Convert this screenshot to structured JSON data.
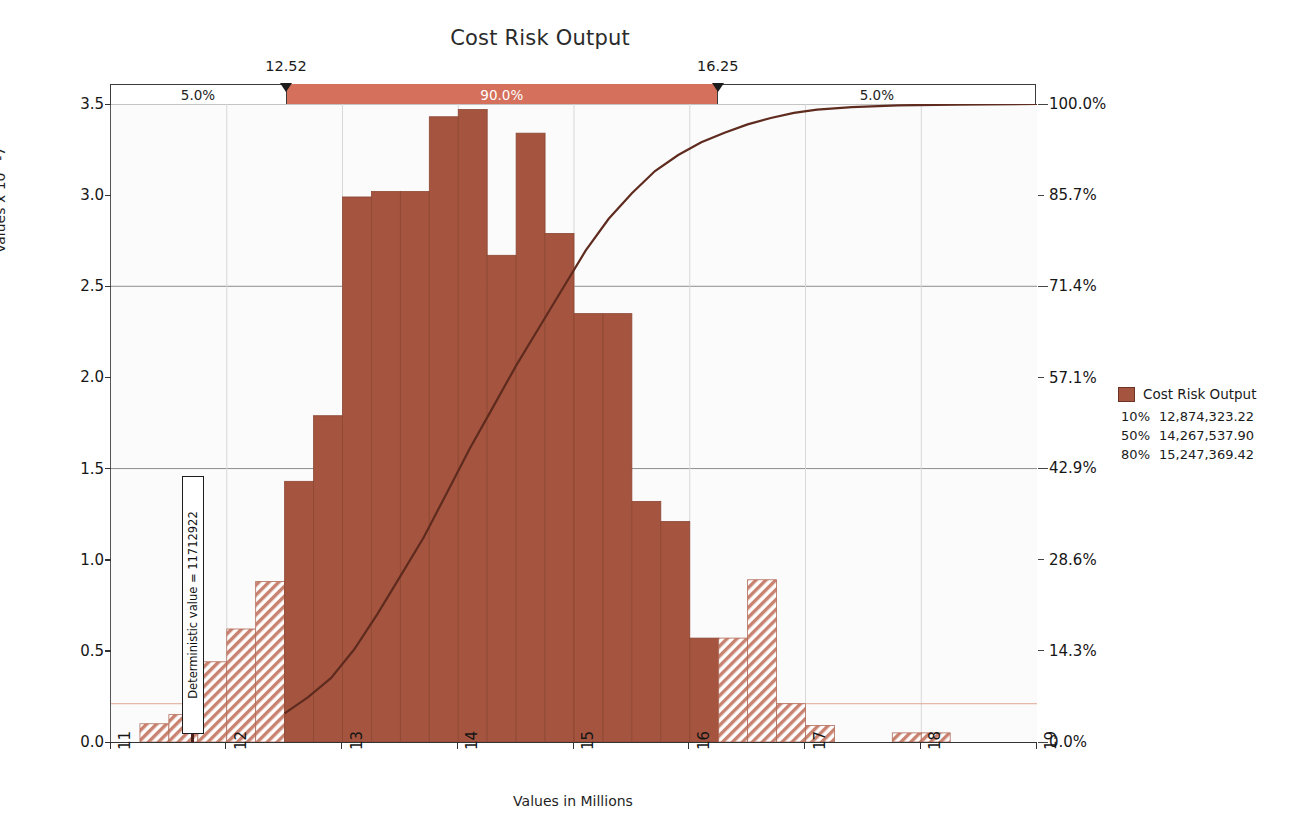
{
  "title": "Cost Risk Output",
  "axes": {
    "ylabel_left": "Values x 10^-7",
    "xlabel": "Values in Millions",
    "yticks_left": [
      "0.0",
      "0.5",
      "1.0",
      "1.5",
      "2.0",
      "2.5",
      "3.0",
      "3.5"
    ],
    "yticks_right": [
      "0.0%",
      "14.3%",
      "28.6%",
      "42.9%",
      "57.1%",
      "71.4%",
      "85.7%",
      "100.0%"
    ],
    "xticks": [
      "11",
      "12",
      "13",
      "14",
      "15",
      "16",
      "17",
      "18",
      "19"
    ],
    "xlim": [
      11,
      19
    ],
    "ylim_left": [
      0.0,
      3.5
    ],
    "ylim_right": [
      0.0,
      100.0
    ]
  },
  "slider": {
    "left_pct": "5.0%",
    "mid_pct": "90.0%",
    "right_pct": "5.0%",
    "left_marker": "12.52",
    "right_marker": "16.25",
    "band_color": "#D4705C"
  },
  "annotation": {
    "deterministic_label": "Deterministic value = 11712922",
    "deterministic_x": 11.712922
  },
  "legend": {
    "series_name": "Cost Risk Output",
    "swatch_color": "#A4543F",
    "stats": [
      {
        "percentile": "10%",
        "value": "12,874,323.22"
      },
      {
        "percentile": "50%",
        "value": "14,267,537.90"
      },
      {
        "percentile": "80%",
        "value": "15,247,369.42"
      }
    ]
  },
  "colors": {
    "bar_fill": "#A4543F",
    "bar_hatch": "#C98270",
    "curve": "#5E2B1E",
    "grid": "#9a9a9a",
    "plot_bg": "#fbfbfc"
  },
  "chart_data": {
    "type": "bar",
    "title": "Cost Risk Output",
    "xlabel": "Values in Millions",
    "ylabel": "Values x 10^-7",
    "xlim": [
      11,
      19
    ],
    "ylim": [
      0,
      3.5
    ],
    "grid": true,
    "legend_position": "right",
    "bin_width": 0.25,
    "in_range_min": 12.52,
    "in_range_max": 16.25,
    "bins": [
      {
        "x0": 11.0,
        "x1": 11.25,
        "value": 0.0,
        "in_range": false
      },
      {
        "x0": 11.25,
        "x1": 11.5,
        "value": 0.1,
        "in_range": false
      },
      {
        "x0": 11.5,
        "x1": 11.75,
        "value": 0.15,
        "in_range": false
      },
      {
        "x0": 11.75,
        "x1": 12.0,
        "value": 0.44,
        "in_range": false
      },
      {
        "x0": 12.0,
        "x1": 12.25,
        "value": 0.62,
        "in_range": false
      },
      {
        "x0": 12.25,
        "x1": 12.5,
        "value": 0.88,
        "in_range": false
      },
      {
        "x0": 12.5,
        "x1": 12.75,
        "value": 1.43,
        "in_range": true
      },
      {
        "x0": 12.75,
        "x1": 13.0,
        "value": 1.79,
        "in_range": true
      },
      {
        "x0": 13.0,
        "x1": 13.25,
        "value": 2.99,
        "in_range": true
      },
      {
        "x0": 13.25,
        "x1": 13.5,
        "value": 3.02,
        "in_range": true
      },
      {
        "x0": 13.5,
        "x1": 13.75,
        "value": 3.02,
        "in_range": true
      },
      {
        "x0": 13.75,
        "x1": 14.0,
        "value": 3.43,
        "in_range": true
      },
      {
        "x0": 14.0,
        "x1": 14.25,
        "value": 3.47,
        "in_range": true
      },
      {
        "x0": 14.25,
        "x1": 14.5,
        "value": 2.67,
        "in_range": true
      },
      {
        "x0": 14.5,
        "x1": 14.75,
        "value": 3.34,
        "in_range": true
      },
      {
        "x0": 14.75,
        "x1": 15.0,
        "value": 2.79,
        "in_range": true
      },
      {
        "x0": 15.0,
        "x1": 15.25,
        "value": 2.35,
        "in_range": true
      },
      {
        "x0": 15.25,
        "x1": 15.5,
        "value": 2.35,
        "in_range": true
      },
      {
        "x0": 15.5,
        "x1": 15.75,
        "value": 1.32,
        "in_range": true
      },
      {
        "x0": 15.75,
        "x1": 16.0,
        "value": 1.21,
        "in_range": true
      },
      {
        "x0": 16.0,
        "x1": 16.25,
        "value": 0.57,
        "in_range": true
      },
      {
        "x0": 16.25,
        "x1": 16.5,
        "value": 0.57,
        "in_range": false
      },
      {
        "x0": 16.5,
        "x1": 16.75,
        "value": 0.89,
        "in_range": false
      },
      {
        "x0": 16.75,
        "x1": 17.0,
        "value": 0.21,
        "in_range": false
      },
      {
        "x0": 17.0,
        "x1": 17.25,
        "value": 0.09,
        "in_range": false
      },
      {
        "x0": 17.25,
        "x1": 17.5,
        "value": 0.0,
        "in_range": false
      },
      {
        "x0": 17.5,
        "x1": 17.75,
        "value": 0.0,
        "in_range": false
      },
      {
        "x0": 17.75,
        "x1": 18.0,
        "value": 0.05,
        "in_range": false
      },
      {
        "x0": 18.0,
        "x1": 18.25,
        "value": 0.05,
        "in_range": false
      }
    ],
    "cumulative_curve": {
      "name": "Cumulative %",
      "x": [
        12.5,
        12.7,
        12.9,
        13.1,
        13.3,
        13.5,
        13.7,
        13.9,
        14.1,
        14.3,
        14.5,
        14.7,
        14.9,
        15.1,
        15.3,
        15.5,
        15.7,
        15.9,
        16.1,
        16.3,
        16.5,
        16.7,
        16.9,
        17.1,
        17.4,
        17.8,
        18.3,
        19.0
      ],
      "y": [
        4.5,
        7.0,
        10.0,
        14.5,
        20.0,
        26.0,
        32.0,
        39.0,
        46.0,
        52.5,
        59.0,
        65.0,
        71.0,
        77.0,
        82.0,
        86.0,
        89.5,
        92.0,
        94.0,
        95.5,
        96.8,
        97.8,
        98.6,
        99.1,
        99.5,
        99.8,
        99.9,
        100.0
      ]
    }
  }
}
